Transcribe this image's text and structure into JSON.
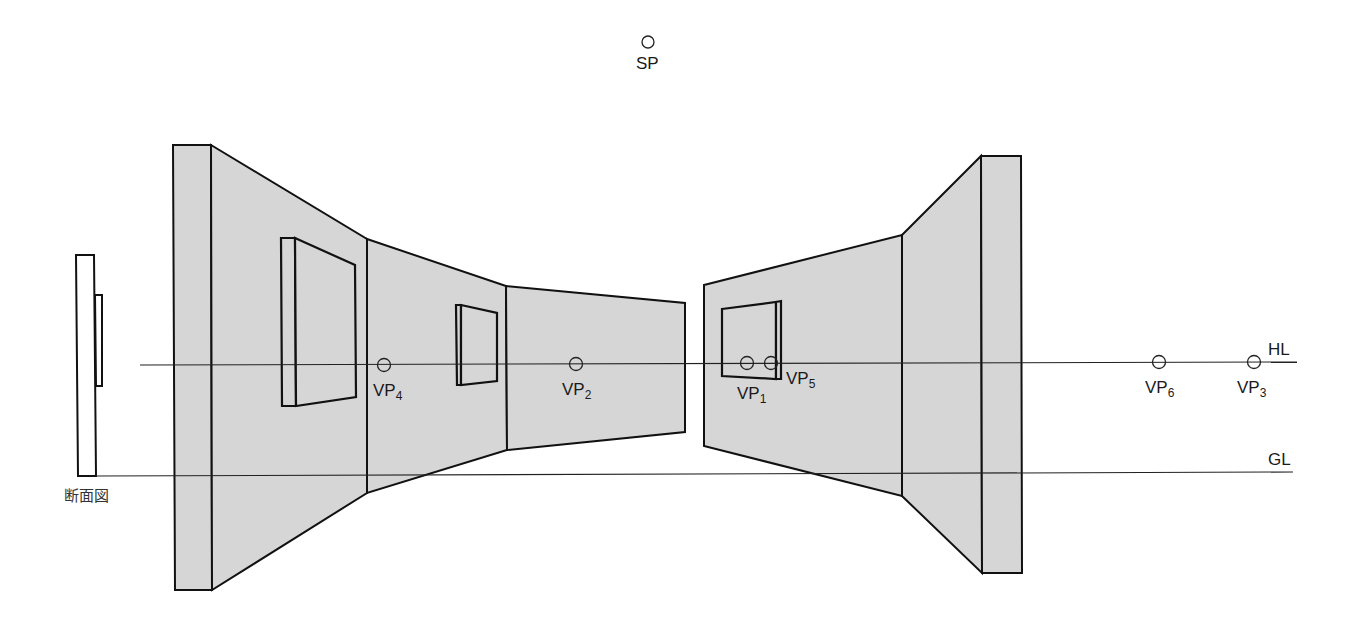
{
  "diagram": {
    "type": "two-point / multi-vanishing-point perspective construction",
    "colors": {
      "wall_fill": "#d6d6d6",
      "stroke": "#111111",
      "background": "#ffffff"
    },
    "station_point": {
      "label": "SP"
    },
    "lines": {
      "horizon": {
        "label": "HL"
      },
      "ground": {
        "label": "GL"
      }
    },
    "section_view": {
      "label": "断面図"
    },
    "vanishing_points": [
      {
        "id": "VP1",
        "main": "VP",
        "sub": "1"
      },
      {
        "id": "VP2",
        "main": "VP",
        "sub": "2"
      },
      {
        "id": "VP3",
        "main": "VP",
        "sub": "3"
      },
      {
        "id": "VP4",
        "main": "VP",
        "sub": "4"
      },
      {
        "id": "VP5",
        "main": "VP",
        "sub": "5"
      },
      {
        "id": "VP6",
        "main": "VP",
        "sub": "6"
      }
    ]
  }
}
